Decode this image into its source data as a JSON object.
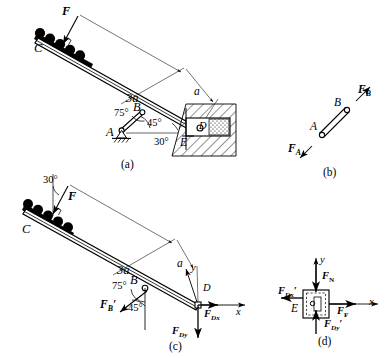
{
  "figure": {
    "title_implicit": "Statics free-body diagrams of an inclined beam with two-force member and sliding block",
    "background_color": "#ffffff",
    "ink_color": "#000000",
    "panels": [
      {
        "key": "a",
        "label": "(a)",
        "caption": "Complete structure with wall slot"
      },
      {
        "key": "b",
        "label": "(b)",
        "caption": "Two-force member AB"
      },
      {
        "key": "c",
        "label": "(c)",
        "caption": "Free body of beam CD"
      },
      {
        "key": "d",
        "label": "(d)",
        "caption": "Free body of block at E"
      }
    ]
  },
  "panel_a": {
    "sublabel": "(a)",
    "points": {
      "C": "C",
      "A": "A",
      "B": "B",
      "E": "E",
      "D": "D"
    },
    "load_label": "F",
    "dim_long": "3a",
    "dim_short": "a",
    "angles": {
      "at_B": "75°",
      "at_A": "45°",
      "at_E": "30°"
    },
    "support": "pin-support-A"
  },
  "panel_b": {
    "sublabel": "(b)",
    "points": {
      "A": "A",
      "B": "B"
    },
    "forces": [
      {
        "name": "F_A",
        "base": "F",
        "sub": "A"
      },
      {
        "name": "F_B",
        "base": "F",
        "sub": "B"
      }
    ]
  },
  "panel_c": {
    "sublabel": "(c)",
    "points": {
      "C": "C",
      "B": "B",
      "D": "D"
    },
    "load_label": "F",
    "dim_long": "3a",
    "dim_short": "a",
    "angles": {
      "top_30": "30°",
      "at_B_75": "75°",
      "at_B_45": "45°"
    },
    "axes": {
      "x": "x",
      "y": "y"
    },
    "forces": [
      {
        "name": "F_B_prime",
        "base": "F",
        "sub": "B",
        "prime": "′"
      },
      {
        "name": "F_Dx",
        "base": "F",
        "sub": "Dx"
      },
      {
        "name": "F_Dy",
        "base": "F",
        "sub": "Dy"
      }
    ]
  },
  "panel_d": {
    "sublabel": "(d)",
    "points": {
      "E": "E"
    },
    "axes": {
      "x": "x",
      "y": "y"
    },
    "forces": [
      {
        "name": "F_N",
        "base": "F",
        "sub": "N"
      },
      {
        "name": "F_F",
        "base": "F",
        "sub": "F"
      },
      {
        "name": "F_Dx_prime",
        "base": "F",
        "sub": "Dx",
        "prime": "′"
      },
      {
        "name": "F_Dy_prime",
        "base": "F",
        "sub": "Dy",
        "prime": "′"
      }
    ]
  }
}
